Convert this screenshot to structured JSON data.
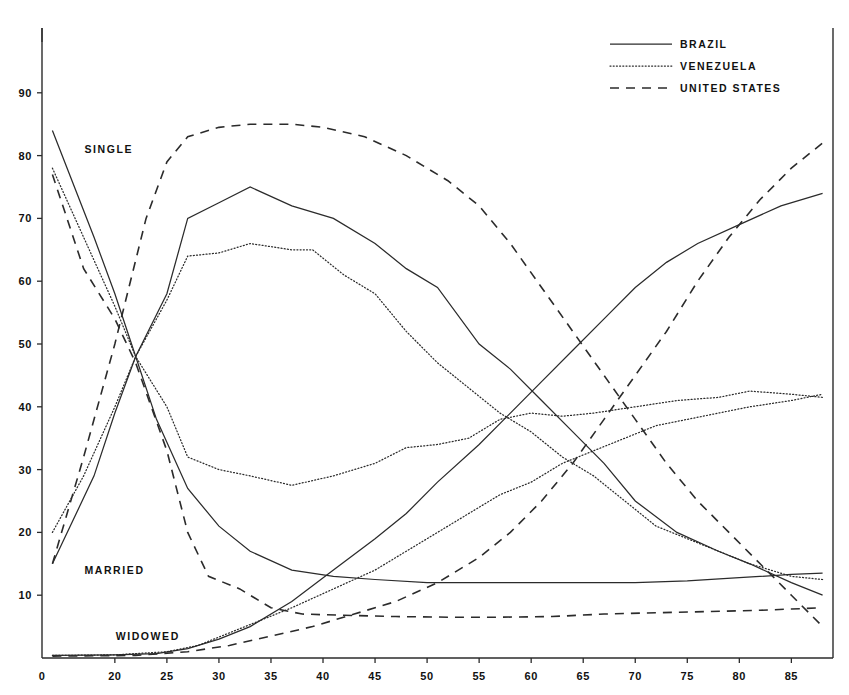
{
  "legend": {
    "position": "top-right",
    "entries": [
      {
        "label": "BRAZIL",
        "style": "solid"
      },
      {
        "label": "VENEZUELA",
        "style": "dotted"
      },
      {
        "label": "UNITED STATES",
        "style": "dashed"
      }
    ]
  },
  "group_labels": [
    {
      "text": "SINGLE",
      "x": 14,
      "y": 81
    },
    {
      "text": "MARRIED",
      "x": 14,
      "y": 14
    },
    {
      "text": "WIDOWED",
      "x": 17,
      "y": 3.5
    }
  ],
  "axes": {
    "x_ticks": [
      0,
      20,
      25,
      30,
      35,
      40,
      45,
      50,
      55,
      60,
      65,
      70,
      75,
      80,
      85
    ],
    "y_ticks": [
      10,
      20,
      30,
      40,
      50,
      60,
      70,
      80,
      90
    ],
    "xlim": [
      13,
      89
    ],
    "ylim": [
      0,
      100
    ],
    "xlabel": "",
    "ylabel": "",
    "grid": false
  },
  "chart_data": {
    "type": "line",
    "xlabel": "",
    "ylabel": "",
    "xlim": [
      13,
      89
    ],
    "ylim": [
      0,
      100
    ],
    "x_ticks": [
      0,
      20,
      25,
      30,
      35,
      40,
      45,
      50,
      55,
      60,
      65,
      70,
      75,
      80,
      85
    ],
    "y_ticks": [
      10,
      20,
      30,
      40,
      50,
      60,
      70,
      80,
      90
    ],
    "grid": false,
    "legend": [
      "BRAZIL",
      "VENEZUELA",
      "UNITED STATES"
    ],
    "annotations": [
      "SINGLE",
      "MARRIED",
      "WIDOWED"
    ],
    "series": [
      {
        "name": "BRAZIL",
        "group": "SINGLE",
        "style": "solid",
        "points": [
          [
            14,
            84
          ],
          [
            18,
            67
          ],
          [
            20,
            58
          ],
          [
            22,
            48
          ],
          [
            24,
            38
          ],
          [
            27,
            27
          ],
          [
            30,
            21
          ],
          [
            33,
            17
          ],
          [
            37,
            14
          ],
          [
            41,
            13
          ],
          [
            45,
            12.5
          ],
          [
            50,
            12
          ],
          [
            55,
            12
          ],
          [
            60,
            12
          ],
          [
            65,
            12
          ],
          [
            70,
            12
          ],
          [
            75,
            12.3
          ],
          [
            80,
            12.8
          ],
          [
            85,
            13.3
          ],
          [
            88,
            13.5
          ]
        ]
      },
      {
        "name": "VENEZUELA",
        "group": "SINGLE",
        "style": "dotted",
        "points": [
          [
            14,
            78
          ],
          [
            17,
            67
          ],
          [
            20,
            56
          ],
          [
            22,
            48
          ],
          [
            25,
            40
          ],
          [
            27,
            32
          ],
          [
            30,
            30
          ],
          [
            33,
            29
          ],
          [
            37,
            27.5
          ],
          [
            41,
            29
          ],
          [
            45,
            31
          ],
          [
            48,
            33.5
          ],
          [
            51,
            34
          ],
          [
            54,
            35
          ],
          [
            57,
            38
          ],
          [
            60,
            39
          ],
          [
            63,
            38.5
          ],
          [
            66,
            39
          ],
          [
            70,
            40
          ],
          [
            74,
            41
          ],
          [
            78,
            41.5
          ],
          [
            81,
            42.5
          ],
          [
            85,
            42
          ],
          [
            88,
            41.5
          ]
        ]
      },
      {
        "name": "UNITED STATES",
        "group": "SINGLE",
        "style": "dashed",
        "points": [
          [
            14,
            77
          ],
          [
            17,
            62
          ],
          [
            20,
            54
          ],
          [
            22,
            47
          ],
          [
            25,
            33
          ],
          [
            27,
            20
          ],
          [
            29,
            13
          ],
          [
            32,
            11
          ],
          [
            35,
            8
          ],
          [
            38,
            7
          ],
          [
            42,
            6.8
          ],
          [
            47,
            6.6
          ],
          [
            52,
            6.5
          ],
          [
            57,
            6.5
          ],
          [
            62,
            6.6
          ],
          [
            67,
            7
          ],
          [
            72,
            7.2
          ],
          [
            77,
            7.4
          ],
          [
            82,
            7.6
          ],
          [
            85,
            7.8
          ],
          [
            88,
            8
          ]
        ]
      },
      {
        "name": "BRAZIL",
        "group": "MARRIED",
        "style": "solid",
        "points": [
          [
            14,
            15
          ],
          [
            18,
            29
          ],
          [
            20,
            39
          ],
          [
            22,
            48
          ],
          [
            25,
            58
          ],
          [
            27,
            70
          ],
          [
            30,
            72.5
          ],
          [
            33,
            75
          ],
          [
            37,
            72
          ],
          [
            41,
            70
          ],
          [
            45,
            66
          ],
          [
            48,
            62
          ],
          [
            51,
            59
          ],
          [
            55,
            50
          ],
          [
            58,
            46
          ],
          [
            61,
            41
          ],
          [
            64,
            36
          ],
          [
            67,
            31
          ],
          [
            70,
            25
          ],
          [
            74,
            20
          ],
          [
            78,
            17
          ],
          [
            81,
            15
          ],
          [
            85,
            12
          ],
          [
            88,
            10
          ]
        ]
      },
      {
        "name": "VENEZUELA",
        "group": "MARRIED",
        "style": "dotted",
        "points": [
          [
            14,
            20
          ],
          [
            17,
            29
          ],
          [
            20,
            40
          ],
          [
            22,
            48
          ],
          [
            25,
            57
          ],
          [
            27,
            64
          ],
          [
            30,
            64.5
          ],
          [
            33,
            66
          ],
          [
            37,
            65
          ],
          [
            39,
            65
          ],
          [
            42,
            61
          ],
          [
            45,
            58
          ],
          [
            48,
            52
          ],
          [
            51,
            47
          ],
          [
            54,
            43
          ],
          [
            57,
            39
          ],
          [
            60,
            36
          ],
          [
            63,
            32
          ],
          [
            66,
            29
          ],
          [
            69,
            25
          ],
          [
            72,
            21
          ],
          [
            75,
            19
          ],
          [
            78,
            17
          ],
          [
            81,
            15
          ],
          [
            85,
            13
          ],
          [
            88,
            12.5
          ]
        ]
      },
      {
        "name": "UNITED STATES",
        "group": "MARRIED",
        "style": "dashed",
        "points": [
          [
            14,
            15
          ],
          [
            17,
            32
          ],
          [
            20,
            50
          ],
          [
            23,
            70
          ],
          [
            25,
            79
          ],
          [
            27,
            83
          ],
          [
            30,
            84.5
          ],
          [
            33,
            85
          ],
          [
            37,
            85
          ],
          [
            40,
            84.5
          ],
          [
            44,
            83
          ],
          [
            48,
            80
          ],
          [
            52,
            76
          ],
          [
            55,
            72
          ],
          [
            58,
            66
          ],
          [
            61,
            59
          ],
          [
            64,
            52
          ],
          [
            67,
            45
          ],
          [
            70,
            38
          ],
          [
            73,
            31
          ],
          [
            76,
            25
          ],
          [
            79,
            20
          ],
          [
            82,
            15
          ],
          [
            85,
            10
          ],
          [
            88,
            5
          ]
        ]
      },
      {
        "name": "BRAZIL",
        "group": "WIDOWED",
        "style": "solid",
        "points": [
          [
            14,
            0.4
          ],
          [
            20,
            0.5
          ],
          [
            24,
            0.7
          ],
          [
            27,
            1.5
          ],
          [
            30,
            3
          ],
          [
            33,
            5
          ],
          [
            37,
            9
          ],
          [
            41,
            14
          ],
          [
            45,
            19
          ],
          [
            48,
            23
          ],
          [
            51,
            28
          ],
          [
            55,
            34
          ],
          [
            58,
            39
          ],
          [
            61,
            44
          ],
          [
            64,
            49
          ],
          [
            67,
            54
          ],
          [
            70,
            59
          ],
          [
            73,
            63
          ],
          [
            76,
            66
          ],
          [
            80,
            69
          ],
          [
            84,
            72
          ],
          [
            88,
            74
          ]
        ]
      },
      {
        "name": "VENEZUELA",
        "group": "WIDOWED",
        "style": "dotted",
        "points": [
          [
            14,
            0.4
          ],
          [
            20,
            0.5
          ],
          [
            25,
            1
          ],
          [
            28,
            2
          ],
          [
            31,
            4
          ],
          [
            34,
            6
          ],
          [
            37,
            8
          ],
          [
            41,
            11
          ],
          [
            45,
            14
          ],
          [
            48,
            17
          ],
          [
            51,
            20
          ],
          [
            54,
            23
          ],
          [
            57,
            26
          ],
          [
            60,
            28
          ],
          [
            63,
            31
          ],
          [
            66,
            33
          ],
          [
            69,
            35
          ],
          [
            72,
            37
          ],
          [
            75,
            38
          ],
          [
            78,
            39
          ],
          [
            81,
            40
          ],
          [
            85,
            41
          ],
          [
            88,
            42
          ]
        ]
      },
      {
        "name": "UNITED STATES",
        "group": "WIDOWED",
        "style": "dashed",
        "points": [
          [
            14,
            0.3
          ],
          [
            22,
            0.4
          ],
          [
            27,
            1
          ],
          [
            31,
            2
          ],
          [
            35,
            3.5
          ],
          [
            39,
            5
          ],
          [
            43,
            7
          ],
          [
            47,
            9
          ],
          [
            51,
            12
          ],
          [
            55,
            16
          ],
          [
            58,
            20
          ],
          [
            61,
            25
          ],
          [
            64,
            31
          ],
          [
            67,
            38
          ],
          [
            70,
            45
          ],
          [
            73,
            52
          ],
          [
            76,
            60
          ],
          [
            79,
            67
          ],
          [
            82,
            73
          ],
          [
            85,
            78
          ],
          [
            88,
            82
          ]
        ]
      }
    ]
  }
}
